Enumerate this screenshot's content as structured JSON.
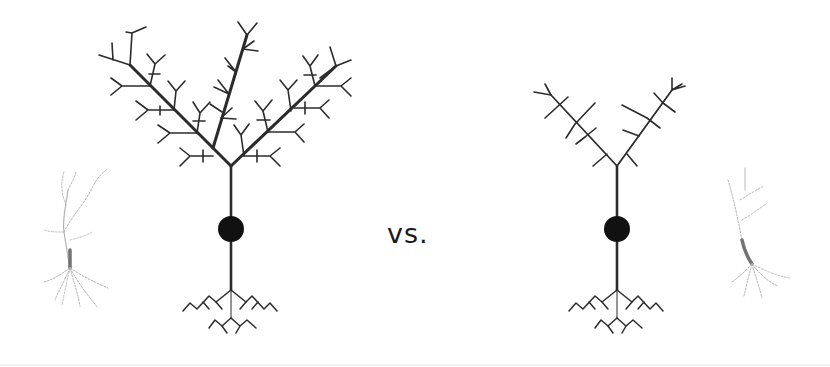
{
  "diagram": {
    "comparison_label": "vs.",
    "colors": {
      "background": "#ffffff",
      "line": "#2b2b2b",
      "soma": "#111111",
      "photo_neuron": "#8a8a8a"
    },
    "left_neuron": {
      "description": "schematic pyramidal neuron with highly branched apical dendritic tree",
      "trunk_x": 231,
      "branch_point_y": 166,
      "soma": {
        "cx": 231,
        "cy": 229,
        "r": 13
      },
      "axon_end_y": 290,
      "apical_branches": 3,
      "branching": "dense"
    },
    "right_neuron": {
      "description": "schematic pyramidal neuron with sparse apical dendritic tree",
      "trunk_x": 617,
      "branch_point_y": 166,
      "soma": {
        "cx": 617,
        "cy": 229,
        "r": 13
      },
      "axon_end_y": 290,
      "apical_branches": 2,
      "branching": "sparse"
    },
    "left_photo": {
      "description": "faint micrograph of a pyramidal neuron (dense)",
      "x": 40,
      "y": 165
    },
    "right_photo": {
      "description": "faint micrograph of a pyramidal neuron (sparse)",
      "x": 718,
      "y": 165
    }
  }
}
